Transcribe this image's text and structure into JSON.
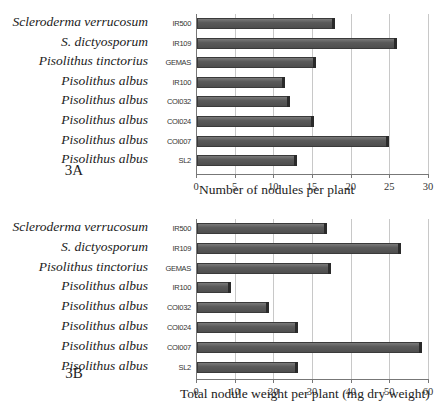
{
  "chart_data": [
    {
      "type": "bar",
      "orientation": "horizontal",
      "panel_label": "3A",
      "title": "",
      "xlabel": "Number of nodules per plant",
      "ylabel": "",
      "categories": [
        "IR500",
        "IR109",
        "GEMAS",
        "IR100",
        "COI032",
        "COI024",
        "COI007",
        "SL2"
      ],
      "species": [
        "Scleroderma verrucosum",
        "S. dictyosporum",
        "Pisolithus tinctorius",
        "Pisolithus albus",
        "Pisolithus albus",
        "Pisolithus albus",
        "Pisolithus albus",
        "Pisolithus albus"
      ],
      "values": [
        18,
        26,
        15.5,
        11.5,
        12.2,
        15.2,
        25,
        13
      ],
      "xlim": [
        0,
        30
      ],
      "xticks": [
        "0",
        "5",
        "10",
        "15",
        "20",
        "25",
        "30"
      ],
      "grid": true,
      "legend": null
    },
    {
      "type": "bar",
      "orientation": "horizontal",
      "panel_label": "3B",
      "title": "",
      "xlabel": "Total nodule weight per plant (mg dry weight)",
      "ylabel": "",
      "categories": [
        "IR500",
        "IR109",
        "GEMAS",
        "IR100",
        "COI032",
        "COI024",
        "COI007",
        "SL2"
      ],
      "species": [
        "Scleroderma verrucosum",
        "S. dictyosporum",
        "Pisolithus tinctorius",
        "Pisolithus albus",
        "Pisolithus albus",
        "Pisolithus albus",
        "Pisolithus albus",
        "Pisolithus albus"
      ],
      "values": [
        34,
        53,
        35,
        9,
        19,
        26.5,
        58.5,
        26.5
      ],
      "xlim": [
        0,
        60
      ],
      "xticks": [
        "0",
        "10",
        "20",
        "30",
        "40",
        "50",
        "60"
      ],
      "grid": true,
      "legend": null
    }
  ],
  "colors": {
    "bar": "#555555",
    "grid": "#c8c8c8",
    "axis": "#777777"
  }
}
